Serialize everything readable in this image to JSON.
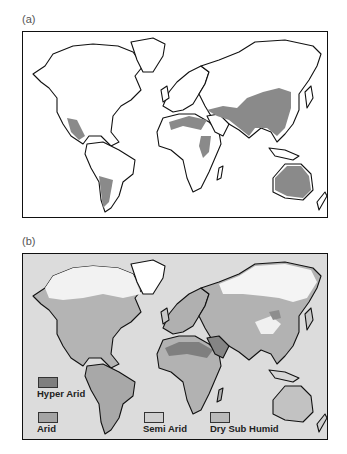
{
  "figure": {
    "panels": [
      {
        "label": "(a)",
        "description": "World map with dryland regions shaded grey",
        "colors": {
          "land": "#ffffff",
          "shaded": "#8a8a8a",
          "ocean": "#ffffff",
          "outline": "#111111"
        }
      },
      {
        "label": "(b)",
        "description": "World map of aridity zones",
        "colors": {
          "ocean": "#dcdcdc",
          "outline": "#111111"
        },
        "legend": [
          {
            "label": "Hyper Arid",
            "color": "#7f7f7f"
          },
          {
            "label": "Arid",
            "color": "#a4a4a4"
          },
          {
            "label": "Semi Arid",
            "color": "#cfcfcf"
          },
          {
            "label": "Dry Sub Humid",
            "color": "#b9b9b9"
          }
        ]
      }
    ]
  }
}
